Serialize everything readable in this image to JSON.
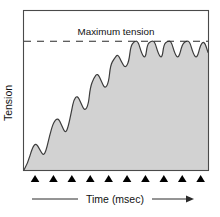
{
  "chart_data": {
    "type": "area",
    "title": "",
    "xlabel": "Time (msec)",
    "ylabel": "Tension",
    "grid": false,
    "legend": null,
    "xlim": [
      0,
      100
    ],
    "ylim": [
      0,
      100
    ],
    "axis_tick_labels": {
      "x": [],
      "y": []
    },
    "annotations": [
      {
        "name": "maximum-tension",
        "label": "Maximum tension",
        "kind": "horizontal-dashed-line",
        "y_value": 81,
        "label_x": 50,
        "label_y": 88
      }
    ],
    "stimulus_marker": {
      "name": "stimulus-arrowhead",
      "glyph": "triangle-up",
      "count": 10,
      "color": "#000000",
      "x_values": [
        6,
        16,
        26,
        36,
        46,
        56,
        66,
        76,
        86,
        96
      ]
    },
    "series": [
      {
        "name": "Muscle tension (wave summation to tetanus)",
        "fill_color": "#d2d2d2",
        "line_color": "#3d3d3d",
        "x": [
          0,
          2,
          4.5,
          6.5,
          8.5,
          10.5,
          12,
          14,
          16,
          18.5,
          20.5,
          22.5,
          24,
          26,
          27,
          29,
          31,
          33,
          35,
          36,
          38,
          40,
          42,
          44,
          46,
          47,
          49,
          51,
          53,
          55,
          57,
          58,
          60,
          62,
          64,
          66,
          67,
          69,
          71,
          73,
          75,
          76,
          78,
          80,
          82,
          84,
          86,
          88,
          90,
          92,
          94,
          96,
          98,
          100
        ],
        "y": [
          0,
          4,
          14,
          17,
          13,
          9,
          12,
          22,
          30,
          33,
          28,
          23,
          27,
          38,
          44,
          47,
          42,
          37,
          41,
          52,
          58,
          61,
          56,
          51,
          55,
          66,
          70,
          73,
          68,
          64,
          68,
          78,
          81,
          81,
          73,
          70,
          79,
          81,
          81,
          73,
          70,
          79,
          81,
          81,
          73,
          70,
          79,
          81,
          81,
          73,
          70,
          79,
          81,
          74
        ],
        "peak_values": [
          17,
          33,
          47,
          61,
          73,
          81,
          81,
          81,
          81,
          81
        ],
        "trough_values": [
          9,
          23,
          37,
          51,
          64,
          70,
          70,
          70,
          70
        ]
      }
    ]
  },
  "axes": {
    "y_label": "Tension",
    "x_label": "Time (msec)",
    "frame_color": "#4a4a4a"
  },
  "annotation": {
    "maximum_tension_label": "Maximum tension"
  },
  "colors": {
    "fill": "#d2d2d2",
    "trace": "#3d3d3d",
    "frame": "#4a4a4a",
    "marker": "#000000",
    "text": "#111111",
    "background": "#ffffff"
  }
}
